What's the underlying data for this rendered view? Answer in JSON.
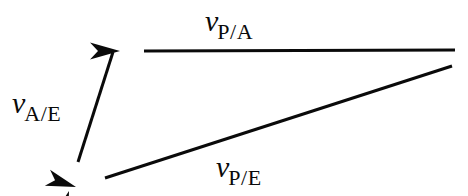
{
  "figure": {
    "type": "vector-diagram",
    "background_color": "#ffffff",
    "stroke_color": "#0a0a0a",
    "stroke_width": 3
  },
  "labels": {
    "v_pa": {
      "symbol": "v",
      "subscript": "P/A"
    },
    "v_ae": {
      "symbol": "v",
      "subscript": "A/E"
    },
    "v_pe": {
      "symbol": "v",
      "subscript": "P/E"
    }
  },
  "vectors": [
    {
      "name": "v-p-a",
      "label": "v P/A",
      "tail": {
        "x": 455,
        "y": 50
      },
      "head": {
        "x": 120,
        "y": 51
      },
      "direction": "left"
    },
    {
      "name": "v-a-e",
      "label": "v A/E",
      "tail": {
        "x": 113,
        "y": 52
      },
      "head": {
        "x": 69,
        "y": 191
      },
      "direction": "down-left"
    },
    {
      "name": "v-p-e",
      "label": "v P/E",
      "tail": {
        "x": 452,
        "y": 66
      },
      "head": {
        "x": 76,
        "y": 187
      },
      "direction": "down-left"
    }
  ]
}
